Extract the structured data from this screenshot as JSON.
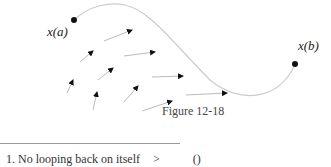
{
  "figure": {
    "label_a": "x(a)",
    "label_b": "x(b)",
    "caption": "Figure 12-18",
    "point_a": {
      "x": 74,
      "y": 20
    },
    "point_b": {
      "x": 295,
      "y": 64
    },
    "arrows": [
      {
        "x1": 104,
        "y1": 41,
        "x2": 132,
        "y2": 30
      },
      {
        "x1": 80,
        "y1": 62,
        "x2": 93,
        "y2": 51
      },
      {
        "x1": 124,
        "y1": 56,
        "x2": 155,
        "y2": 52
      },
      {
        "x1": 98,
        "y1": 80,
        "x2": 113,
        "y2": 68
      },
      {
        "x1": 152,
        "y1": 77,
        "x2": 183,
        "y2": 76
      },
      {
        "x1": 67,
        "y1": 93,
        "x2": 73,
        "y2": 80
      },
      {
        "x1": 93,
        "y1": 110,
        "x2": 97,
        "y2": 92
      },
      {
        "x1": 124,
        "y1": 102,
        "x2": 138,
        "y2": 86
      },
      {
        "x1": 142,
        "y1": 111,
        "x2": 172,
        "y2": 101
      },
      {
        "x1": 186,
        "y1": 95,
        "x2": 227,
        "y2": 93
      }
    ]
  },
  "text": {
    "item_1": "1.  No looping back on itself",
    "arrow_glyph": ">",
    "paren_glyph": "()"
  }
}
